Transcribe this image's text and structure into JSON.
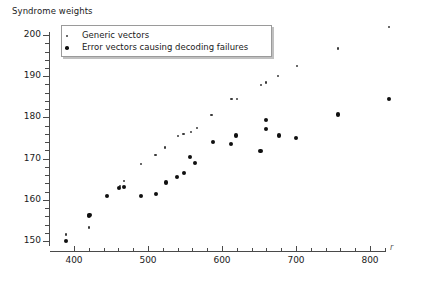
{
  "chart_data": {
    "type": "scatter",
    "title": "Syndrome weights",
    "xlabel": "r",
    "ylabel": "",
    "xlim": [
      380,
      845
    ],
    "ylim": [
      147,
      204
    ],
    "xticks": [
      400,
      500,
      600,
      700,
      800
    ],
    "yticks": [
      150,
      160,
      170,
      180,
      190,
      200
    ],
    "xtick_labels": [
      "400",
      "500",
      "600",
      "700",
      "800"
    ],
    "ytick_labels": [
      "150",
      "160",
      "170",
      "180",
      "190",
      "200"
    ],
    "grid": false,
    "legend_position": "upper-left",
    "series": [
      {
        "name": "Generic vectors",
        "marker": "small-dot",
        "color": "#3a3a3a",
        "points": [
          [
            389,
            151.6
          ],
          [
            420,
            153.3
          ],
          [
            462,
            163.3
          ],
          [
            468,
            164.5
          ],
          [
            491,
            168.7
          ],
          [
            510,
            170.9
          ],
          [
            523,
            172.7
          ],
          [
            541,
            175.5
          ],
          [
            548,
            176.0
          ],
          [
            558,
            176.5
          ],
          [
            566,
            177.4
          ],
          [
            586,
            180.6
          ],
          [
            613,
            184.4
          ],
          [
            620,
            184.4
          ],
          [
            653,
            187.8
          ],
          [
            659,
            188.5
          ],
          [
            676,
            190.0
          ],
          [
            701,
            192.4
          ],
          [
            757,
            196.7
          ],
          [
            826,
            202.0
          ]
        ]
      },
      {
        "name": "Error vectors causing decoding failures",
        "marker": "large-dot",
        "color": "#101010",
        "points": [
          [
            389,
            149.9
          ],
          [
            420,
            156.1
          ],
          [
            421,
            156.3
          ],
          [
            444,
            160.9
          ],
          [
            461,
            162.9
          ],
          [
            467,
            163.2
          ],
          [
            491,
            160.9
          ],
          [
            511,
            161.4
          ],
          [
            524,
            164.2
          ],
          [
            539,
            165.6
          ],
          [
            549,
            166.6
          ],
          [
            557,
            170.3
          ],
          [
            564,
            168.9
          ],
          [
            588,
            174.0
          ],
          [
            612,
            173.5
          ],
          [
            619,
            175.6
          ],
          [
            652,
            171.9
          ],
          [
            659,
            177.1
          ],
          [
            660,
            179.4
          ],
          [
            677,
            175.6
          ],
          [
            700,
            175.1
          ],
          [
            757,
            180.7
          ],
          [
            826,
            184.4
          ]
        ]
      }
    ]
  }
}
